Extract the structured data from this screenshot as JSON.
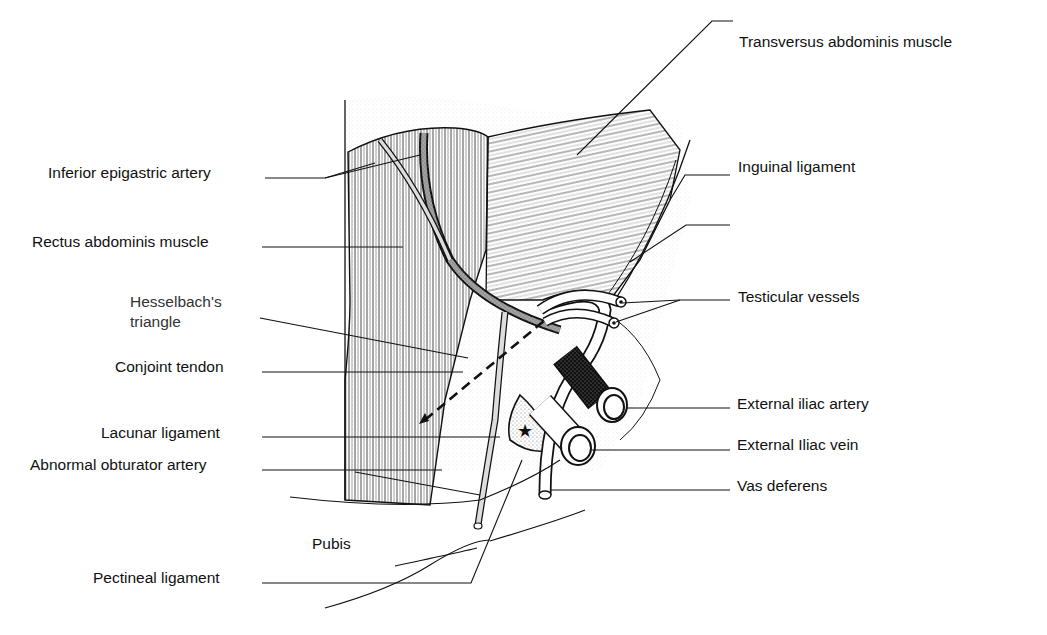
{
  "figure": {
    "type": "anatomical illustration"
  },
  "labels": {
    "left": [
      {
        "id": "inferior_epigastric_artery",
        "text": "Inferior epigastric artery"
      },
      {
        "id": "rectus_abdominis_muscle",
        "text": "Rectus abdominis muscle"
      },
      {
        "id": "hesselbachs_triangle_line1",
        "text": "Hesselbach's"
      },
      {
        "id": "hesselbachs_triangle_line2",
        "text": "triangle"
      },
      {
        "id": "conjoint_tendon",
        "text": "Conjoint tendon"
      },
      {
        "id": "lacunar_ligament",
        "text": "Lacunar ligament"
      },
      {
        "id": "abnormal_obturator_artery",
        "text": "Abnormal obturator artery"
      },
      {
        "id": "pectineal_ligament",
        "text": "Pectineal ligament"
      }
    ],
    "right": [
      {
        "id": "transversus_abdominis_muscle",
        "text": "Transversus abdominis muscle"
      },
      {
        "id": "inguinal_ligament",
        "text": "Inguinal ligament"
      },
      {
        "id": "testicular_vessels",
        "text": "Testicular vessels"
      },
      {
        "id": "external_iliac_artery",
        "text": "External iliac artery"
      },
      {
        "id": "external_iliac_vein",
        "text": "External Iliac vein"
      },
      {
        "id": "vas_deferens",
        "text": "Vas deferens"
      }
    ],
    "inline": [
      {
        "id": "pubis",
        "text": "Pubis"
      }
    ]
  },
  "colors": {
    "ink": "#1a1a1a",
    "background": "#ffffff",
    "stipple": "#999999"
  }
}
